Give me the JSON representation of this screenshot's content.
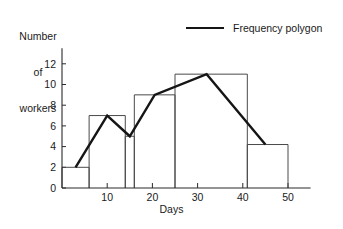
{
  "chart_data": {
    "type": "bar",
    "title": "",
    "xlabel": "Days",
    "ylabel": "Number of workers",
    "xlim": [
      0,
      55
    ],
    "ylim": [
      0,
      13.5
    ],
    "grid": false,
    "x_ticks": [
      10,
      20,
      30,
      40,
      50
    ],
    "x_tick_labels": [
      "10",
      "20",
      "30",
      "40",
      "50"
    ],
    "y_ticks": [
      0,
      2,
      4,
      6,
      8,
      10,
      12
    ],
    "y_tick_labels": [
      "0",
      "2",
      "4",
      "6",
      "8",
      "10",
      "12"
    ],
    "legend": {
      "position": "top-right",
      "entries": [
        {
          "label": "Frequency polygon",
          "color": "#151515",
          "style": "line"
        }
      ]
    },
    "bars": [
      {
        "x_start": 0,
        "x_end": 6,
        "height": 2
      },
      {
        "x_start": 6,
        "x_end": 14,
        "height": 7
      },
      {
        "x_start": 14,
        "x_end": 16,
        "height": 5
      },
      {
        "x_start": 16,
        "x_end": 25,
        "height": 9
      },
      {
        "x_start": 25,
        "x_end": 41,
        "height": 11
      },
      {
        "x_start": 41,
        "x_end": 50,
        "height": 4.2
      }
    ],
    "series": [
      {
        "name": "Frequency polygon",
        "type": "line",
        "points": [
          {
            "x": 3,
            "y": 2
          },
          {
            "x": 10,
            "y": 7
          },
          {
            "x": 15,
            "y": 5
          },
          {
            "x": 20.5,
            "y": 9
          },
          {
            "x": 32,
            "y": 11
          },
          {
            "x": 45,
            "y": 4.2
          }
        ]
      }
    ]
  },
  "labels": {
    "y_title_line1": "Number",
    "y_title_line2": "of",
    "y_title_line3": "workers",
    "x_title": "Days",
    "legend_label": "Frequency polygon"
  }
}
